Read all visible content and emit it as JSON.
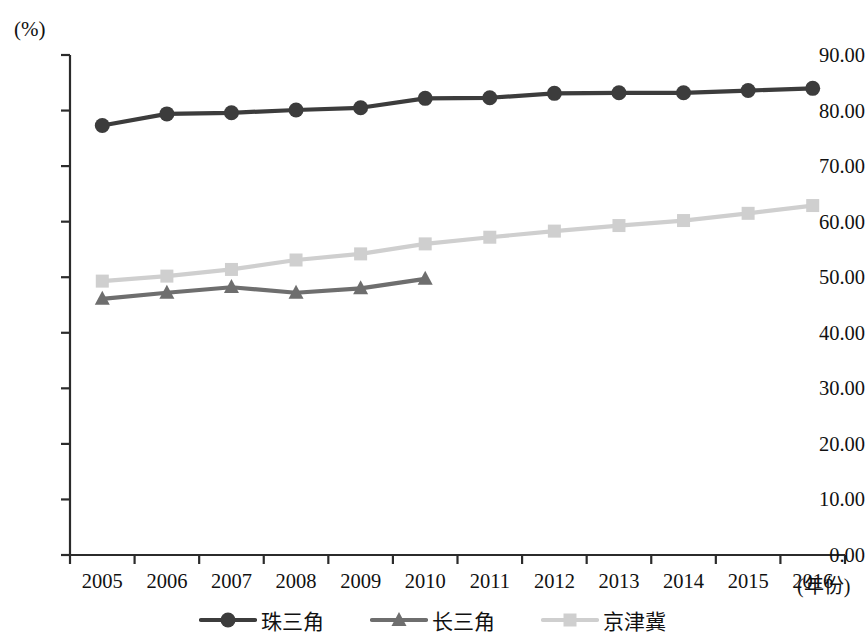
{
  "chart_data": {
    "type": "line",
    "title": "",
    "xlabel": "(年份)",
    "ylabel": "(%)",
    "x": [
      2005,
      2006,
      2007,
      2008,
      2009,
      2010,
      2011,
      2012,
      2013,
      2014,
      2015,
      2016
    ],
    "categories": [
      "2005",
      "2006",
      "2007",
      "2008",
      "2009",
      "2010",
      "2011",
      "2012",
      "2013",
      "2014",
      "2015",
      "2016"
    ],
    "ylim": [
      0,
      90
    ],
    "ytick_labels": [
      "0.00",
      "10.00",
      "20.00",
      "30.00",
      "40.00",
      "50.00",
      "60.00",
      "70.00",
      "80.00",
      "90.00"
    ],
    "ytick_values": [
      0,
      10,
      20,
      30,
      40,
      50,
      60,
      70,
      80,
      90
    ],
    "grid": false,
    "legend_position": "bottom",
    "series": [
      {
        "name": "珠三角",
        "marker": "circle",
        "color": "#3c3c3c",
        "values": [
          77.3,
          79.4,
          79.6,
          80.1,
          80.5,
          82.2,
          82.3,
          83.1,
          83.2,
          83.2,
          83.6,
          84.0
        ]
      },
      {
        "name": "长三角",
        "marker": "triangle",
        "color": "#6e6e6e",
        "values": [
          46.1,
          47.2,
          48.2,
          47.2,
          48.0,
          49.7,
          null,
          null,
          null,
          null,
          null,
          null
        ]
      },
      {
        "name": "京津冀",
        "marker": "square",
        "color": "#cfcfcf",
        "values": [
          49.3,
          50.2,
          51.4,
          53.1,
          54.2,
          56.0,
          57.2,
          58.3,
          59.3,
          60.2,
          61.5,
          62.9
        ]
      }
    ]
  },
  "axis": {
    "y_unit": "(%)",
    "x_unit": "(年份)"
  },
  "legend": {
    "items": [
      {
        "label": "珠三角",
        "marker": "circle-marker",
        "color": "#3c3c3c"
      },
      {
        "label": "长三角",
        "marker": "triangle-marker",
        "color": "#6e6e6e"
      },
      {
        "label": "京津冀",
        "marker": "square-marker",
        "color": "#cfcfcf"
      }
    ]
  }
}
